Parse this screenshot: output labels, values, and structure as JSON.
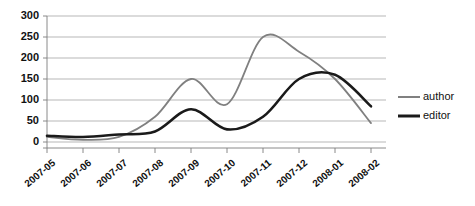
{
  "chart_data": {
    "type": "line",
    "title": "",
    "xlabel": "",
    "ylabel": "",
    "x": [
      "2007-05",
      "2007-06",
      "2007-07",
      "2007-08",
      "2007-09",
      "2007-10",
      "2007-11",
      "2007-12",
      "2008-01",
      "2008-02"
    ],
    "categories": [
      "2007-05",
      "2007-06",
      "2007-07",
      "2007-08",
      "2007-09",
      "2007-10",
      "2007-11",
      "2007-12",
      "2008-01",
      "2008-02"
    ],
    "series": [
      {
        "name": "author",
        "color": "#808080",
        "values": [
          12,
          5,
          12,
          60,
          150,
          90,
          250,
          215,
          150,
          45
        ]
      },
      {
        "name": "editor",
        "color": "#1a1a1a",
        "values": [
          15,
          12,
          18,
          25,
          78,
          30,
          60,
          150,
          160,
          85
        ]
      }
    ],
    "ylim": [
      0,
      300
    ],
    "yticks": [
      0,
      50,
      100,
      150,
      200,
      250,
      300
    ],
    "ytick_labels": [
      "0",
      "50",
      "100",
      "150",
      "200",
      "250",
      "300"
    ],
    "grid": true,
    "legend_position": "right",
    "smoothing": "spline"
  },
  "legend": {
    "items": [
      {
        "label": "author",
        "color": "#808080",
        "width": 2.0
      },
      {
        "label": "editor",
        "color": "#1a1a1a",
        "width": 3.0
      }
    ]
  },
  "axes": {
    "y_tick_labels": [
      "300",
      "250",
      "200",
      "150",
      "100",
      "50",
      "0"
    ],
    "x_tick_labels": [
      "2007-05",
      "2007-06",
      "2007-07",
      "2007-08",
      "2007-09",
      "2007-10",
      "2007-11",
      "2007-12",
      "2008-01",
      "2008-02"
    ]
  }
}
